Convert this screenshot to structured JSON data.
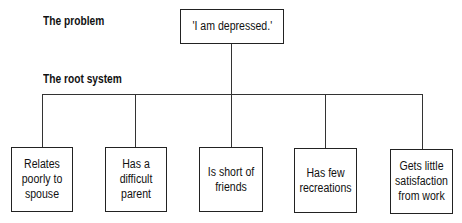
{
  "labels": {
    "problem": "The problem",
    "root_system": "The root system"
  },
  "problem_box": {
    "text": "'I am depressed.'"
  },
  "roots": [
    {
      "text": "Relates poorly to spouse"
    },
    {
      "text": "Has a difficult parent"
    },
    {
      "text": "Is short of friends"
    },
    {
      "text": "Has few recreations"
    },
    {
      "text": "Gets little satisfaction from work"
    }
  ]
}
